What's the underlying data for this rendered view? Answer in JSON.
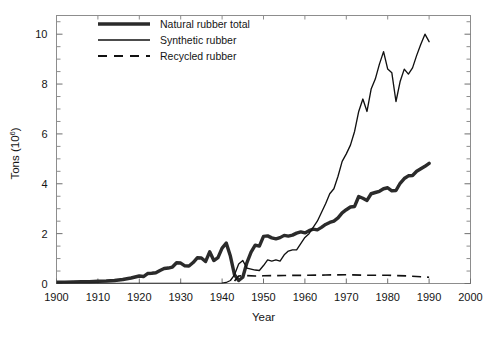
{
  "chart_data": {
    "type": "line",
    "title": "",
    "xlabel": "Year",
    "ylabel": "Tons (10",
    "ylabel_exponent": "6",
    "ylabel_close": ")",
    "xlim": [
      1900,
      2000
    ],
    "ylim": [
      0,
      10.75
    ],
    "grid": false,
    "legend_position": "top-left",
    "x_ticks": [
      1900,
      1910,
      1920,
      1930,
      1940,
      1950,
      1960,
      1970,
      1980,
      1990,
      2000
    ],
    "x_tick_labels": [
      "1900",
      "1910",
      "1920",
      "1930",
      "1940",
      "1950",
      "1960",
      "1970",
      "1980",
      "1990",
      "2000"
    ],
    "y_ticks": [
      0,
      2,
      4,
      6,
      8,
      10
    ],
    "y_tick_labels": [
      "0",
      "2",
      "4",
      "6",
      "8",
      "10"
    ],
    "y_minor_step": 0.5,
    "series": [
      {
        "name": "Natural rubber total",
        "style": "thick-solid",
        "color": "#2b2b2b",
        "x": [
          1900,
          1902,
          1904,
          1906,
          1908,
          1910,
          1912,
          1914,
          1916,
          1918,
          1920,
          1921,
          1922,
          1923,
          1924,
          1925,
          1926,
          1927,
          1928,
          1929,
          1930,
          1931,
          1932,
          1933,
          1934,
          1935,
          1936,
          1937,
          1938,
          1939,
          1940,
          1941,
          1942,
          1943,
          1944,
          1945,
          1946,
          1947,
          1948,
          1949,
          1950,
          1951,
          1952,
          1953,
          1954,
          1955,
          1956,
          1957,
          1958,
          1959,
          1960,
          1961,
          1962,
          1963,
          1964,
          1965,
          1966,
          1967,
          1968,
          1969,
          1970,
          1971,
          1972,
          1973,
          1974,
          1975,
          1976,
          1977,
          1978,
          1979,
          1980,
          1981,
          1982,
          1983,
          1984,
          1985,
          1986,
          1987,
          1988,
          1989,
          1990
        ],
        "y": [
          0.05,
          0.05,
          0.06,
          0.07,
          0.07,
          0.09,
          0.1,
          0.12,
          0.16,
          0.22,
          0.3,
          0.28,
          0.4,
          0.41,
          0.43,
          0.52,
          0.6,
          0.62,
          0.66,
          0.83,
          0.82,
          0.71,
          0.7,
          0.84,
          1.03,
          1.02,
          0.88,
          1.27,
          0.92,
          1.04,
          1.42,
          1.62,
          1.1,
          0.35,
          0.12,
          0.25,
          0.84,
          1.26,
          1.54,
          1.5,
          1.89,
          1.91,
          1.83,
          1.79,
          1.84,
          1.93,
          1.9,
          1.94,
          2.02,
          2.07,
          2.03,
          2.12,
          2.18,
          2.15,
          2.25,
          2.37,
          2.45,
          2.5,
          2.63,
          2.83,
          2.96,
          3.07,
          3.09,
          3.49,
          3.42,
          3.33,
          3.6,
          3.65,
          3.7,
          3.8,
          3.84,
          3.72,
          3.73,
          4.02,
          4.21,
          4.32,
          4.33,
          4.5,
          4.6,
          4.7,
          4.82
        ]
      },
      {
        "name": "Synthetic rubber",
        "style": "thin-solid",
        "color": "#111111",
        "x": [
          1900,
          1930,
          1935,
          1938,
          1940,
          1941,
          1942,
          1943,
          1944,
          1945,
          1946,
          1947,
          1948,
          1949,
          1950,
          1951,
          1952,
          1953,
          1954,
          1955,
          1956,
          1957,
          1958,
          1959,
          1960,
          1961,
          1962,
          1963,
          1964,
          1965,
          1966,
          1967,
          1968,
          1969,
          1970,
          1971,
          1972,
          1973,
          1974,
          1975,
          1976,
          1977,
          1978,
          1979,
          1980,
          1981,
          1982,
          1983,
          1984,
          1985,
          1986,
          1987,
          1988,
          1989,
          1990
        ],
        "y": [
          0.0,
          0.0,
          0.0,
          0.0,
          0.01,
          0.04,
          0.12,
          0.35,
          0.78,
          0.92,
          0.62,
          0.58,
          0.54,
          0.52,
          0.72,
          0.95,
          0.9,
          0.95,
          0.9,
          1.15,
          1.3,
          1.35,
          1.35,
          1.6,
          1.85,
          2.0,
          2.25,
          2.5,
          2.85,
          3.2,
          3.6,
          3.8,
          4.3,
          4.9,
          5.2,
          5.55,
          6.1,
          6.9,
          7.4,
          6.9,
          7.8,
          8.2,
          8.8,
          9.3,
          8.6,
          8.45,
          7.3,
          8.1,
          8.6,
          8.4,
          8.65,
          9.15,
          9.6,
          10.0,
          9.7
        ]
      },
      {
        "name": "Recycled rubber",
        "style": "dashed",
        "color": "#111111",
        "x": [
          1943,
          1944,
          1946,
          1948,
          1950,
          1955,
          1960,
          1965,
          1970,
          1975,
          1980,
          1985,
          1988,
          1990
        ],
        "y": [
          0.1,
          0.3,
          0.32,
          0.3,
          0.31,
          0.32,
          0.33,
          0.34,
          0.35,
          0.33,
          0.33,
          0.3,
          0.27,
          0.25
        ]
      }
    ]
  }
}
